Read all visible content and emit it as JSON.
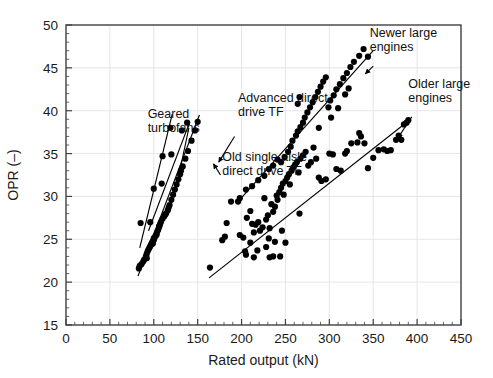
{
  "chart_data": {
    "type": "scatter",
    "title": "",
    "xlabel": "Rated output (kN)",
    "ylabel": "OPR (–)",
    "xlim": [
      0,
      450
    ],
    "ylim": [
      15,
      50
    ],
    "xticks": [
      0,
      50,
      100,
      150,
      200,
      250,
      300,
      350,
      400,
      450
    ],
    "xtick_labels": [
      "0",
      "50",
      "100",
      "150",
      "200",
      "250",
      "300",
      "350",
      "400",
      "450"
    ],
    "yticks": [
      15,
      20,
      25,
      30,
      35,
      40,
      45,
      50
    ],
    "ytick_labels": [
      "15",
      "20",
      "25",
      "30",
      "35",
      "40",
      "45",
      "50"
    ],
    "x_minor_tick_step": 10,
    "grid": true,
    "grid_color": "#e3e3e3",
    "marker_color": "#000000",
    "marker_size": 3.1,
    "line_color": "#000000",
    "legend_position": "none",
    "annotations": [
      {
        "name": "geared-turbofans",
        "label": "Geared\nturbofans",
        "text_x": 93,
        "text_y": 39.2,
        "arrow_from_x": 140,
        "arrow_from_y": 38.0,
        "arrow_to_x": 128,
        "arrow_to_y": 32.2
      },
      {
        "name": "advanced-direct-drive-tf",
        "label": "Advanced direct\ndrive TF",
        "text_x": 196,
        "text_y": 41.0,
        "arrow_from_x": 192,
        "arrow_from_y": 37.0,
        "arrow_to_x": 174,
        "arrow_to_y": 34.0
      },
      {
        "name": "old-single-aisle-direct-drive-tf",
        "label": "Old single aisle\ndirect drive TF",
        "text_x": 178,
        "text_y": 34.1,
        "arrow_from_x": 176,
        "arrow_from_y": 32.5,
        "arrow_to_x": 168,
        "arrow_to_y": 33.8
      },
      {
        "name": "newer-large-engines",
        "label": "Newer large\nengines",
        "text_x": 346,
        "text_y": 48.6,
        "arrow_from_x": 350,
        "arrow_from_y": 45.2,
        "arrow_to_x": 341,
        "arrow_to_y": 44.3
      },
      {
        "name": "older-large-engines",
        "label": "Older large\nengines",
        "text_x": 390,
        "text_y": 42.6,
        "arrow_from_x": 394,
        "arrow_from_y": 39.3,
        "arrow_to_x": 378,
        "arrow_to_y": 36.8
      }
    ],
    "trend_lines": [
      {
        "name": "geared-turbofans-line",
        "x1": 84,
        "y1": 24.0,
        "x2": 121,
        "y2": 39.6
      },
      {
        "name": "advanced-direct-drive-line",
        "x1": 94,
        "y1": 26.0,
        "x2": 141,
        "y2": 38.7
      },
      {
        "name": "old-single-aisle-line",
        "x1": 82,
        "y1": 20.7,
        "x2": 152,
        "y2": 39.5
      },
      {
        "name": "newer-large-engines-line",
        "x1": 196,
        "y1": 29.4,
        "x2": 350,
        "y2": 47.0
      },
      {
        "name": "older-large-engines-line",
        "x1": 163,
        "y1": 20.5,
        "x2": 390,
        "y2": 38.8
      }
    ],
    "series": [
      {
        "name": "Geared turbofans",
        "points": [
          [
            85,
            26.9
          ],
          [
            100,
            30.9
          ],
          [
            110,
            34.7
          ],
          [
            119,
            38.0
          ]
        ]
      },
      {
        "name": "Advanced direct drive TF",
        "points": [
          [
            96,
            27.0
          ],
          [
            109,
            31.5
          ],
          [
            120,
            34.9
          ],
          [
            132,
            37.7
          ],
          [
            138,
            38.6
          ]
        ]
      },
      {
        "name": "Old single aisle direct drive TF",
        "points": [
          [
            83,
            21.6
          ],
          [
            84,
            21.9
          ],
          [
            86,
            22.1
          ],
          [
            88,
            22.4
          ],
          [
            89,
            22.6
          ],
          [
            91,
            23.0
          ],
          [
            92,
            23.3
          ],
          [
            93,
            23.6
          ],
          [
            94,
            23.8
          ],
          [
            95,
            24.0
          ],
          [
            96,
            24.2
          ],
          [
            97,
            24.4
          ],
          [
            98,
            24.6
          ],
          [
            99,
            24.8
          ],
          [
            100,
            24.9
          ],
          [
            100,
            25.1
          ],
          [
            101,
            25.2
          ],
          [
            102,
            25.4
          ],
          [
            103,
            25.6
          ],
          [
            104,
            25.9
          ],
          [
            105,
            26.1
          ],
          [
            106,
            26.4
          ],
          [
            107,
            26.7
          ],
          [
            108,
            27.0
          ],
          [
            110,
            27.4
          ],
          [
            112,
            27.7
          ],
          [
            113,
            27.9
          ],
          [
            114,
            28.0
          ],
          [
            116,
            28.4
          ],
          [
            118,
            29.0
          ],
          [
            120,
            29.6
          ],
          [
            122,
            30.2
          ],
          [
            124,
            30.8
          ],
          [
            126,
            31.4
          ],
          [
            128,
            32.0
          ],
          [
            130,
            32.6
          ],
          [
            133,
            33.5
          ],
          [
            136,
            34.4
          ],
          [
            139,
            35.3
          ],
          [
            143,
            36.5
          ],
          [
            147,
            37.7
          ],
          [
            150,
            38.7
          ],
          [
            92,
            22.8
          ],
          [
            99,
            24.5
          ],
          [
            103,
            25.5
          ],
          [
            106,
            26.5
          ],
          [
            117,
            28.7
          ],
          [
            131,
            33.0
          ]
        ]
      },
      {
        "name": "Newer large engines",
        "points": [
          [
            198,
            29.8
          ],
          [
            205,
            30.8
          ],
          [
            212,
            31.2
          ],
          [
            219,
            31.9
          ],
          [
            226,
            32.4
          ],
          [
            231,
            33.2
          ],
          [
            236,
            33.6
          ],
          [
            241,
            34.3
          ],
          [
            245,
            34.0
          ],
          [
            249,
            34.6
          ],
          [
            253,
            35.2
          ],
          [
            256,
            35.8
          ],
          [
            258,
            36.5
          ],
          [
            262,
            37.1
          ],
          [
            264,
            37.6
          ],
          [
            267,
            38.1
          ],
          [
            270,
            38.6
          ],
          [
            272,
            39.2
          ],
          [
            275,
            39.8
          ],
          [
            278,
            40.4
          ],
          [
            264,
            40.8
          ],
          [
            266,
            41.6
          ],
          [
            281,
            41.0
          ],
          [
            284,
            41.6
          ],
          [
            287,
            42.2
          ],
          [
            290,
            42.8
          ],
          [
            293,
            43.4
          ],
          [
            296,
            43.9
          ],
          [
            299,
            40.4
          ],
          [
            301,
            41.2
          ],
          [
            305,
            41.8
          ],
          [
            308,
            42.5
          ],
          [
            312,
            43.1
          ],
          [
            316,
            43.8
          ],
          [
            320,
            44.4
          ],
          [
            324,
            45.1
          ],
          [
            328,
            45.7
          ],
          [
            334,
            46.4
          ],
          [
            339,
            47.2
          ],
          [
            344,
            46.3
          ],
          [
            318,
            41.9
          ],
          [
            322,
            42.6
          ],
          [
            310,
            40.3
          ],
          [
            302,
            39.2
          ],
          [
            288,
            38.0
          ]
        ]
      },
      {
        "name": "Older large engines",
        "points": [
          [
            164,
            21.7
          ],
          [
            178,
            24.9
          ],
          [
            181,
            25.3
          ],
          [
            183,
            26.9
          ],
          [
            188,
            29.4
          ],
          [
            196,
            29.4
          ],
          [
            198,
            25.5
          ],
          [
            202,
            25.2
          ],
          [
            204,
            23.6
          ],
          [
            205,
            23.2
          ],
          [
            210,
            24.6
          ],
          [
            214,
            25.8
          ],
          [
            216,
            26.7
          ],
          [
            219,
            27.0
          ],
          [
            221,
            26.0
          ],
          [
            224,
            26.4
          ],
          [
            226,
            29.8
          ],
          [
            228,
            27.3
          ],
          [
            230,
            27.8
          ],
          [
            232,
            26.3
          ],
          [
            234,
            29.1
          ],
          [
            236,
            28.2
          ],
          [
            238,
            28.8
          ],
          [
            240,
            30.1
          ],
          [
            241,
            29.6
          ],
          [
            243,
            30.5
          ],
          [
            245,
            31.0
          ],
          [
            247,
            31.5
          ],
          [
            248,
            30.2
          ],
          [
            250,
            31.8
          ],
          [
            252,
            32.2
          ],
          [
            254,
            32.6
          ],
          [
            255,
            31.4
          ],
          [
            257,
            33.0
          ],
          [
            259,
            33.4
          ],
          [
            261,
            33.7
          ],
          [
            263,
            34.0
          ],
          [
            265,
            32.8
          ],
          [
            267,
            34.4
          ],
          [
            270,
            34.8
          ],
          [
            273,
            35.2
          ],
          [
            276,
            33.6
          ],
          [
            279,
            34.0
          ],
          [
            282,
            35.7
          ],
          [
            285,
            34.4
          ],
          [
            288,
            32.2
          ],
          [
            291,
            31.8
          ],
          [
            296,
            32.0
          ],
          [
            300,
            35.0
          ],
          [
            304,
            34.9
          ],
          [
            308,
            33.2
          ],
          [
            313,
            33.0
          ],
          [
            318,
            35.0
          ],
          [
            320,
            35.3
          ],
          [
            325,
            36.2
          ],
          [
            332,
            36.3
          ],
          [
            334,
            37.4
          ],
          [
            336,
            37.0
          ],
          [
            340,
            36.2
          ],
          [
            344,
            33.3
          ],
          [
            350,
            34.5
          ],
          [
            356,
            35.4
          ],
          [
            362,
            35.5
          ],
          [
            366,
            35.3
          ],
          [
            370,
            35.4
          ],
          [
            376,
            36.6
          ],
          [
            379,
            37.1
          ],
          [
            382,
            36.6
          ],
          [
            385,
            38.4
          ],
          [
            388,
            38.6
          ],
          [
            390,
            38.9
          ],
          [
            232,
            22.9
          ],
          [
            236,
            23.0
          ],
          [
            218,
            23.7
          ],
          [
            228,
            24.1
          ],
          [
            244,
            23.0
          ],
          [
            250,
            24.6
          ],
          [
            214,
            22.9
          ],
          [
            246,
            26.0
          ],
          [
            266,
            28.0
          ],
          [
            206,
            27.5
          ],
          [
            210,
            28.3
          ],
          [
            212,
            26.8
          ],
          [
            231,
            25.1
          ],
          [
            238,
            24.7
          ]
        ]
      }
    ]
  }
}
